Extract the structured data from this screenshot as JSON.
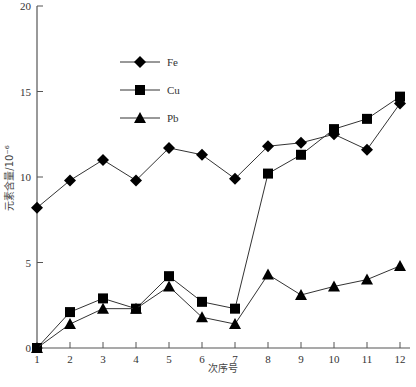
{
  "chart_data": {
    "type": "line",
    "title": "",
    "xlabel": "次序号",
    "ylabel": "元素含量/10⁻⁶",
    "x": [
      1,
      2,
      3,
      4,
      5,
      6,
      7,
      8,
      9,
      10,
      11,
      12
    ],
    "categories": [
      "1",
      "2",
      "3",
      "4",
      "5",
      "6",
      "7",
      "8",
      "9",
      "10",
      "11",
      "12"
    ],
    "ylim": [
      0,
      20
    ],
    "yticks": [
      0,
      5,
      10,
      15,
      20
    ],
    "grid": false,
    "legend_position": "upper-left-inside",
    "series": [
      {
        "name": "Fe",
        "marker": "diamond",
        "values": [
          8.2,
          9.8,
          11.0,
          9.8,
          11.7,
          11.3,
          9.9,
          11.8,
          12.0,
          12.5,
          11.6,
          14.3
        ]
      },
      {
        "name": "Cu",
        "marker": "square",
        "values": [
          0.0,
          2.1,
          2.9,
          2.3,
          4.2,
          2.7,
          2.3,
          10.2,
          11.3,
          12.8,
          13.4,
          14.7
        ]
      },
      {
        "name": "Pb",
        "marker": "triangle",
        "values": [
          0.0,
          1.4,
          2.3,
          2.3,
          3.6,
          1.8,
          1.4,
          4.3,
          3.1,
          3.6,
          4.0,
          4.8
        ]
      }
    ]
  },
  "legend": {
    "items": [
      {
        "label": "Fe",
        "marker": "diamond"
      },
      {
        "label": "Cu",
        "marker": "square"
      },
      {
        "label": "Pb",
        "marker": "triangle"
      }
    ]
  },
  "style": {
    "line_color": "#333333",
    "marker_color": "#000000",
    "axis_color": "#555555"
  }
}
